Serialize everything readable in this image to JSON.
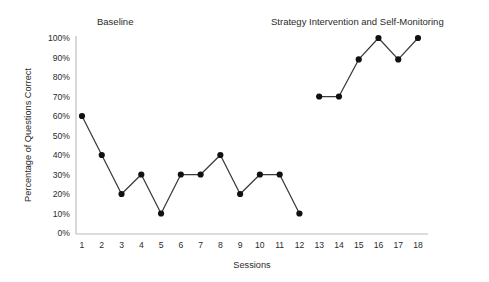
{
  "chart_data": {
    "type": "line",
    "title": "",
    "xlabel": "Sessions",
    "ylabel": "Percentage of Questions Correct",
    "xlim": [
      1,
      18
    ],
    "ylim": [
      0,
      100
    ],
    "grid": false,
    "legend_position": "none",
    "x": [
      1,
      2,
      3,
      4,
      5,
      6,
      7,
      8,
      9,
      10,
      11,
      12,
      13,
      14,
      15,
      16,
      17,
      18
    ],
    "x_tick_labels": [
      "1",
      "2",
      "3",
      "4",
      "5",
      "6",
      "7",
      "8",
      "9",
      "10",
      "11",
      "12",
      "13",
      "14",
      "15",
      "16",
      "17",
      "18"
    ],
    "y_tick_labels": [
      "0%",
      "10%",
      "20%",
      "30%",
      "40%",
      "50%",
      "60%",
      "70%",
      "80%",
      "90%",
      "100%"
    ],
    "y_tick_values": [
      0,
      10,
      20,
      30,
      40,
      50,
      60,
      70,
      80,
      90,
      100
    ],
    "series": [
      {
        "name": "Baseline",
        "x": [
          1,
          2,
          3,
          4,
          5,
          6,
          7,
          8,
          9,
          10,
          11,
          12
        ],
        "values": [
          60,
          40,
          20,
          30,
          10,
          30,
          30,
          40,
          20,
          30,
          30,
          10
        ],
        "marker": "circle",
        "color": "#111111"
      },
      {
        "name": "Strategy Intervention and Self-Monitoring",
        "x": [
          13,
          14,
          15,
          16,
          17,
          18
        ],
        "values": [
          70,
          70,
          89,
          100,
          89,
          100
        ],
        "marker": "circle",
        "color": "#111111"
      }
    ],
    "annotations": [
      {
        "text": "Baseline",
        "x_center": 8.5,
        "position": "top-left"
      },
      {
        "text": "Strategy Intervention and Self-Monitoring",
        "x_center": 15.5,
        "position": "top-right"
      }
    ]
  },
  "phase_labels": {
    "baseline": "Baseline",
    "intervention": "Strategy Intervention and Self-Monitoring"
  },
  "axes": {
    "x_title": "Sessions",
    "y_title": "Percentage of Questions Correct"
  },
  "colors": {
    "line": "#3a3a3a",
    "marker": "#111111",
    "axis": "#b9b9b9",
    "text": "#2b2b2b",
    "background": "#ffffff"
  }
}
